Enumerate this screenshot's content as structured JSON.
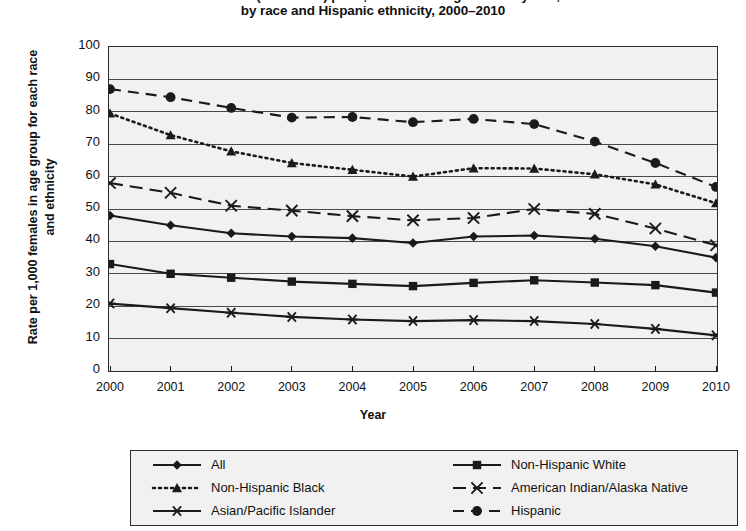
{
  "title": {
    "line1": "Birth rates (live births) per 1,000 females aged 15–19 years,",
    "line2": "by race and Hispanic ethnicity, 2000–2010"
  },
  "axes": {
    "y_title": "Rate per 1,000 females in age group for each race and ethnicity",
    "x_title": "Year",
    "y_ticks": [
      "100",
      "90",
      "80",
      "70",
      "60",
      "50",
      "40",
      "30",
      "20",
      "10",
      "0"
    ],
    "x_ticks": [
      "2000",
      "2001",
      "2002",
      "2003",
      "2004",
      "2005",
      "2006",
      "2007",
      "2008",
      "2009",
      "2010"
    ]
  },
  "legend": {
    "items": [
      {
        "label": "All",
        "marker": "diamond",
        "dash": "solid"
      },
      {
        "label": "Non-Hispanic White",
        "marker": "square",
        "dash": "solid"
      },
      {
        "label": "Non-Hispanic Black",
        "marker": "triangle",
        "dash": "dotted"
      },
      {
        "label": "American Indian/Alaska Native",
        "marker": "cross",
        "dash": "dashdot"
      },
      {
        "label": "Asian/Pacific Islander",
        "marker": "asterisk",
        "dash": "solid"
      },
      {
        "label": "Hispanic",
        "marker": "circle",
        "dash": "dashed"
      }
    ]
  },
  "colors": {
    "ink": "#1a1a1a",
    "plot_background": "#f1f1f1",
    "grid": "#4a4a4a",
    "page_background": "#ffffff"
  },
  "chart_data": {
    "type": "line",
    "title": "Birth rates (live births) per 1,000 females aged 15–19 years, by race and Hispanic ethnicity, 2000–2010",
    "xlabel": "Year",
    "ylabel": "Rate per 1,000 females in age group for each race and ethnicity",
    "x": [
      2000,
      2001,
      2002,
      2003,
      2004,
      2005,
      2006,
      2007,
      2008,
      2009,
      2010
    ],
    "xlim": [
      2000,
      2010
    ],
    "ylim": [
      0,
      100
    ],
    "ytick_step": 10,
    "grid": true,
    "legend_position": "bottom",
    "series": [
      {
        "name": "All",
        "marker": "diamond",
        "dash": "solid",
        "values": [
          48.0,
          45.0,
          42.5,
          41.5,
          41.0,
          39.5,
          41.5,
          41.8,
          40.8,
          38.5,
          35.0
        ]
      },
      {
        "name": "Non-Hispanic White",
        "marker": "square",
        "dash": "solid",
        "values": [
          33.0,
          30.0,
          28.8,
          27.6,
          26.9,
          26.2,
          27.2,
          28.0,
          27.3,
          26.5,
          24.2
        ]
      },
      {
        "name": "Non-Hispanic Black",
        "marker": "triangle",
        "dash": "dotted",
        "values": [
          79.5,
          72.8,
          67.8,
          64.2,
          62.1,
          60.0,
          62.6,
          62.5,
          60.7,
          57.6,
          51.8
        ]
      },
      {
        "name": "American Indian/Alaska Native",
        "marker": "cross",
        "dash": "dashdot",
        "values": [
          58.0,
          55.0,
          51.0,
          49.5,
          47.8,
          46.5,
          47.2,
          50.0,
          48.5,
          44.0,
          38.8
        ]
      },
      {
        "name": "Asian/Pacific Islander",
        "marker": "asterisk",
        "dash": "solid",
        "values": [
          20.8,
          19.4,
          18.0,
          16.7,
          15.9,
          15.4,
          15.7,
          15.4,
          14.5,
          13.0,
          11.0
        ]
      },
      {
        "name": "Hispanic",
        "marker": "circle",
        "dash": "dashed",
        "values": [
          87.0,
          84.5,
          81.2,
          78.2,
          78.4,
          76.8,
          77.8,
          76.2,
          70.8,
          64.2,
          56.8
        ]
      }
    ]
  }
}
